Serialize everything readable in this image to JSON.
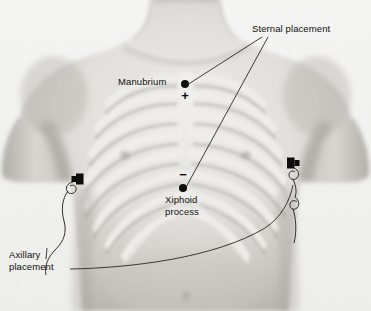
{
  "labels": {
    "sternal": "Sternal placement",
    "manubrium": "Manubrium",
    "xiphoid": "Xiphoid\nprocess",
    "axillary": "Axillary\nplacement"
  },
  "polarity": {
    "positive": "+",
    "negative": "−"
  },
  "markers": [
    {
      "name": "manubrium-electrode-site",
      "x": 185,
      "y": 84
    },
    {
      "name": "xiphoid-electrode-site",
      "x": 183,
      "y": 188
    }
  ],
  "electrodes": [
    {
      "name": "left-axillary-electrode",
      "x": 78,
      "y": 179
    },
    {
      "name": "right-axillary-electrode",
      "x": 291,
      "y": 163
    }
  ],
  "colors": {
    "background": "#f4f4f2",
    "skin_light": "#e9e8e4",
    "skin_mid": "#cfcdc8",
    "skin_shadow": "#b3b0aa",
    "bone": "#f3f2ef",
    "ink": "#12100e",
    "leader_line": "#2a2724"
  }
}
